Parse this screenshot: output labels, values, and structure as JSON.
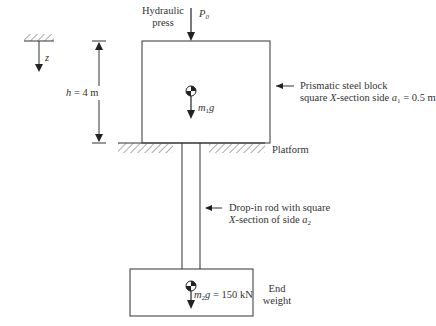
{
  "diagram": {
    "axis": {
      "label": "z"
    },
    "height_dim": {
      "label": "h = 4 m",
      "var": "h",
      "value": "= 4 m"
    },
    "press": {
      "label_line1": "Hydraulic",
      "label_line2": "press",
      "force": "P",
      "force_sub": "0"
    },
    "block": {
      "weight": "m",
      "weight_sub": "1",
      "weight_g": "g",
      "label_line1": "Prismatic steel block",
      "label_line2_pre": "square ",
      "label_line2_x": "X",
      "label_line2_mid": "-section side ",
      "label_line2_var": "a",
      "label_line2_sub": "1",
      "label_line2_val": " = 0.5 m"
    },
    "platform": {
      "label": "Platform"
    },
    "rod": {
      "label_line1": "Drop-in rod with square",
      "label_line2_x": "X",
      "label_line2_mid": "-section of side ",
      "label_line2_var": "a",
      "label_line2_sub": "2"
    },
    "end_weight": {
      "weight": "m",
      "weight_sub": "2",
      "weight_g": "g",
      "weight_val": " = 150 kN",
      "label_line1": "End",
      "label_line2": "weight"
    },
    "colors": {
      "line": "#333333",
      "hatch": "#555555",
      "background": "#ffffff"
    }
  }
}
